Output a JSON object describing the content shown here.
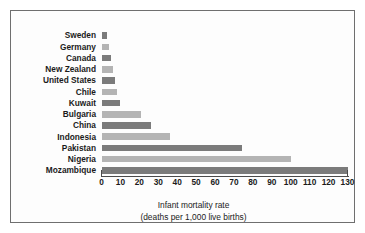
{
  "chart_data": {
    "type": "bar",
    "orientation": "horizontal",
    "title": "",
    "xlabel": "Infant mortality rate",
    "xlabel_line2": "(deaths per 1,000 live births)",
    "ylabel": "",
    "categories": [
      "Sweden",
      "Germany",
      "Canada",
      "New Zealand",
      "United States",
      "Chile",
      "Kuwait",
      "Bulgaria",
      "China",
      "Indonesia",
      "Pakistan",
      "Nigeria",
      "Mozambique"
    ],
    "values": [
      3,
      4,
      5,
      6,
      7,
      8,
      10,
      21,
      26,
      36,
      74,
      100,
      130
    ],
    "xlim": [
      0,
      130
    ],
    "xticks": [
      0,
      10,
      20,
      30,
      40,
      50,
      60,
      70,
      80,
      90,
      100,
      110,
      120,
      130
    ],
    "xtick_labels": [
      "0",
      "10",
      "20",
      "30",
      "40",
      "50",
      "60",
      "70",
      "80",
      "90",
      "100",
      "110",
      "120",
      "130"
    ],
    "grid": false,
    "legend": null,
    "bar_colors": [
      "#7b7b7b",
      "#b4b4b4"
    ],
    "frame_color": "#6f6f6f",
    "axis_color": "#4a4a4a",
    "text_color": "#1b1b1b",
    "background": "#fdfdfd"
  }
}
